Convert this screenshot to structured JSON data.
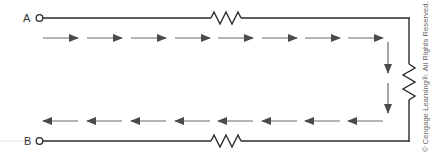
{
  "diagram": {
    "type": "series circuit with current flow",
    "terminals": [
      {
        "label": "A",
        "position": "top-left"
      },
      {
        "label": "B",
        "position": "bottom-left"
      }
    ],
    "resistors": [
      {
        "position": "top wire"
      },
      {
        "position": "right wire"
      },
      {
        "position": "bottom wire"
      }
    ],
    "current_arrows": {
      "top_row": {
        "count": 8,
        "direction": "right"
      },
      "right_column": {
        "count": 2,
        "direction": "down"
      },
      "bottom_row": {
        "count": 8,
        "direction": "left"
      }
    },
    "colors": {
      "wire": "#2a2a2a",
      "arrow": "#555555",
      "label": "#333333",
      "copyright": "#666666"
    }
  },
  "labels": {
    "terminal_a": "A",
    "terminal_b": "B",
    "copyright": "© Cengage Learning®. All Rights Reserved."
  }
}
